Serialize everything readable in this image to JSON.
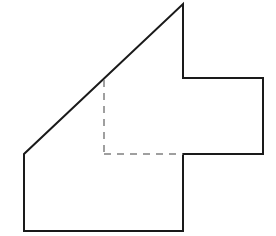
{
  "diagram": {
    "type": "composite-polygon",
    "colors": {
      "background": "#ffffff",
      "outline": "#1a1a1a",
      "dashed": "#808080"
    },
    "outline_points": [
      [
        183,
        4
      ],
      [
        183,
        78
      ],
      [
        263,
        78
      ],
      [
        263,
        154
      ],
      [
        183,
        154
      ],
      [
        183,
        231
      ],
      [
        24,
        231
      ],
      [
        24,
        154
      ],
      [
        183,
        4
      ]
    ],
    "dashed_lines": [
      {
        "from": [
          104,
          80
        ],
        "to": [
          104,
          154
        ]
      },
      {
        "from": [
          104,
          154
        ],
        "to": [
          183,
          154
        ]
      }
    ]
  }
}
